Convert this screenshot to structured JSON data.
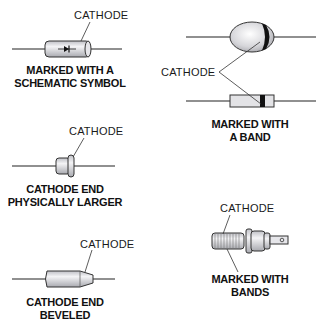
{
  "diagram": {
    "panels": [
      {
        "id": "schematic",
        "callout": "CATHODE",
        "caption_line1": "MARKED WITH A",
        "caption_line2": "SCHEMATIC SYMBOL"
      },
      {
        "id": "band",
        "callout": "CATHODE",
        "caption_line1": "MARKED WITH",
        "caption_line2": "A BAND"
      },
      {
        "id": "larger",
        "callout": "CATHODE",
        "caption_line1": "CATHODE END",
        "caption_line2": "PHYSICALLY LARGER"
      },
      {
        "id": "beveled",
        "callout": "CATHODE",
        "caption_line1": "CATHODE END",
        "caption_line2": "BEVELED"
      },
      {
        "id": "bands",
        "callout": "CATHODE",
        "caption_line1": "MARKED WITH",
        "caption_line2": "BANDS"
      }
    ],
    "colors": {
      "line": "#222222",
      "body_fill": "#d9d9de",
      "band": "#111111",
      "background": "#ffffff"
    }
  }
}
